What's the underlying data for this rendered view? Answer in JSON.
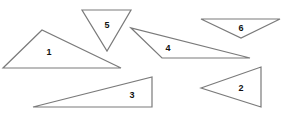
{
  "diagram": {
    "stroke_color": "#7a7a7a",
    "label_color": "#111111",
    "triangles": [
      {
        "label": "1",
        "points": "42,30 3,68 121,68",
        "lx": 49,
        "ly": 53
      },
      {
        "label": "5",
        "points": "82,10 131,10 107,51",
        "lx": 107,
        "ly": 26
      },
      {
        "label": "4",
        "points": "131,28 162,58 250,58",
        "lx": 168,
        "ly": 49
      },
      {
        "label": "6",
        "points": "201,19 280,19 241,38",
        "lx": 241,
        "ly": 29
      },
      {
        "label": "3",
        "points": "33,107 152,77 152,107",
        "lx": 132,
        "ly": 96
      },
      {
        "label": "2",
        "points": "201,88 261,67 261,107",
        "lx": 241,
        "ly": 89
      }
    ]
  }
}
